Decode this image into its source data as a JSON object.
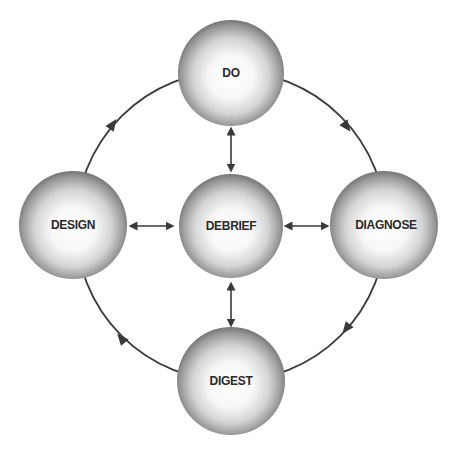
{
  "diagram": {
    "type": "cycle-with-hub",
    "colors": {
      "background": "#ffffff",
      "line": "#3a3a3a",
      "sphere_highlight": "#ffffff",
      "sphere_mid": "#d8d8d8",
      "sphere_edge": "#6a6a6a",
      "label": "#2a2a2a"
    },
    "outer_cycle": {
      "direction": "clockwise",
      "order": [
        "DO",
        "DIAGNOSE",
        "DIGEST",
        "DESIGN"
      ]
    },
    "nodes": {
      "do": {
        "label": "DO"
      },
      "diagnose": {
        "label": "DIAGNOSE"
      },
      "digest": {
        "label": "DIGEST"
      },
      "design": {
        "label": "DESIGN"
      },
      "debrief": {
        "label": "DEBRIEF"
      }
    },
    "hub_connections": [
      {
        "from": "DEBRIEF",
        "to": "DO",
        "type": "bidirectional"
      },
      {
        "from": "DEBRIEF",
        "to": "DIAGNOSE",
        "type": "bidirectional"
      },
      {
        "from": "DEBRIEF",
        "to": "DIGEST",
        "type": "bidirectional"
      },
      {
        "from": "DEBRIEF",
        "to": "DESIGN",
        "type": "bidirectional"
      }
    ]
  }
}
